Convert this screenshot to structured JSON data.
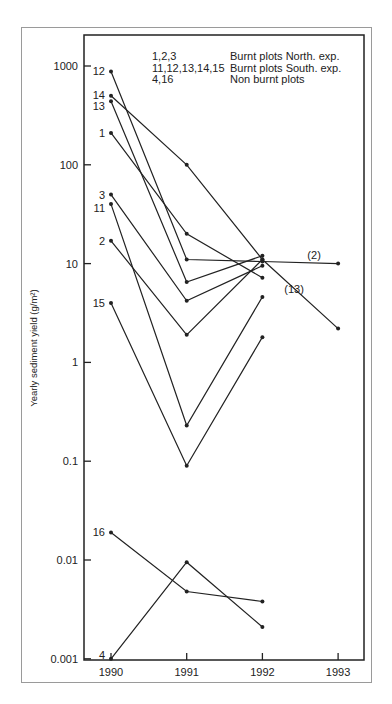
{
  "chart_data": {
    "type": "line",
    "title": "",
    "xlabel": "",
    "ylabel": "Yearly sediment yield (g/m²)",
    "yscale": "log",
    "ylim": [
      0.001,
      2000
    ],
    "xlim": [
      1990,
      1993
    ],
    "x": [
      1990,
      1991,
      1992,
      1993
    ],
    "x_tick_labels": [
      "1990",
      "1991",
      "1992",
      "1993"
    ],
    "y_ticks": [
      1000,
      100,
      10,
      1,
      0.1,
      0.01,
      0.001
    ],
    "y_tick_labels": [
      "1000",
      "100",
      "10",
      "1",
      "0.1",
      "0.01",
      "0.001"
    ],
    "grid": false,
    "legend": {
      "placement": "top-right",
      "entries": [
        {
          "plots": "1,2,3",
          "description": "Burnt plots North. exp."
        },
        {
          "plots": "11,12,13,14,15",
          "description": "Burnt plots South. exp."
        },
        {
          "plots": "4,16",
          "description": "Non burnt plots"
        }
      ]
    },
    "series": [
      {
        "name": "12",
        "values": [
          880,
          11,
          10.5,
          10
        ],
        "end_label": "(2)"
      },
      {
        "name": "14",
        "values": [
          500,
          100,
          11,
          2.2
        ],
        "end_label": "(13)"
      },
      {
        "name": "13",
        "values": [
          440,
          6.5,
          12,
          null
        ]
      },
      {
        "name": "1",
        "values": [
          210,
          20,
          7.2,
          null
        ]
      },
      {
        "name": "3",
        "values": [
          50,
          4.2,
          9.5,
          null
        ]
      },
      {
        "name": "11",
        "values": [
          40,
          0.23,
          4.6,
          null
        ]
      },
      {
        "name": "2",
        "values": [
          17,
          1.9,
          11,
          null
        ]
      },
      {
        "name": "15",
        "values": [
          4,
          0.09,
          1.8,
          null
        ]
      },
      {
        "name": "16",
        "values": [
          0.019,
          0.0048,
          0.0038,
          null
        ]
      },
      {
        "name": "4",
        "values": [
          0.001,
          0.0095,
          0.0021,
          null
        ]
      }
    ]
  }
}
